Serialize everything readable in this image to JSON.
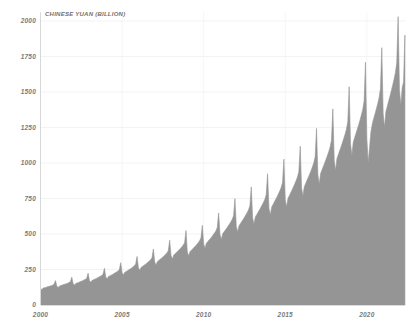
{
  "chart_data": {
    "type": "area",
    "title": "CHINESE YUAN (BILLION)",
    "xlabel": "",
    "ylabel": "CHINESE YUAN (BILLION)",
    "ylim": [
      0,
      2000
    ],
    "xlim": [
      2000,
      2022.4
    ],
    "grid": true,
    "legend_position": "none",
    "yticks": [
      0,
      250,
      500,
      750,
      1000,
      1250,
      1500,
      1750,
      2000
    ],
    "ytick_labels": [
      "0",
      "250",
      "500",
      "750",
      "1000",
      "1250",
      "1500",
      "1750",
      "2000"
    ],
    "xticks": [
      2000,
      2005,
      2010,
      2015,
      2020
    ],
    "xtick_labels": [
      "2000",
      "2005",
      "2010",
      "2015",
      "2020"
    ],
    "series_name": "Chinese Yuan (Billion)",
    "fill_color": "#959595",
    "x": [
      2000.0,
      2000.083,
      2000.167,
      2000.25,
      2000.333,
      2000.417,
      2000.5,
      2000.583,
      2000.667,
      2000.75,
      2000.833,
      2000.917,
      2001.0,
      2001.083,
      2001.167,
      2001.25,
      2001.333,
      2001.417,
      2001.5,
      2001.583,
      2001.667,
      2001.75,
      2001.833,
      2001.917,
      2002.0,
      2002.083,
      2002.167,
      2002.25,
      2002.333,
      2002.417,
      2002.5,
      2002.583,
      2002.667,
      2002.75,
      2002.833,
      2002.917,
      2003.0,
      2003.083,
      2003.167,
      2003.25,
      2003.333,
      2003.417,
      2003.5,
      2003.583,
      2003.667,
      2003.75,
      2003.833,
      2003.917,
      2004.0,
      2004.083,
      2004.167,
      2004.25,
      2004.333,
      2004.417,
      2004.5,
      2004.583,
      2004.667,
      2004.75,
      2004.833,
      2004.917,
      2005.0,
      2005.083,
      2005.167,
      2005.25,
      2005.333,
      2005.417,
      2005.5,
      2005.583,
      2005.667,
      2005.75,
      2005.833,
      2005.917,
      2006.0,
      2006.083,
      2006.167,
      2006.25,
      2006.333,
      2006.417,
      2006.5,
      2006.583,
      2006.667,
      2006.75,
      2006.833,
      2006.917,
      2007.0,
      2007.083,
      2007.167,
      2007.25,
      2007.333,
      2007.417,
      2007.5,
      2007.583,
      2007.667,
      2007.75,
      2007.833,
      2007.917,
      2008.0,
      2008.083,
      2008.167,
      2008.25,
      2008.333,
      2008.417,
      2008.5,
      2008.583,
      2008.667,
      2008.75,
      2008.833,
      2008.917,
      2009.0,
      2009.083,
      2009.167,
      2009.25,
      2009.333,
      2009.417,
      2009.5,
      2009.583,
      2009.667,
      2009.75,
      2009.833,
      2009.917,
      2010.0,
      2010.083,
      2010.167,
      2010.25,
      2010.333,
      2010.417,
      2010.5,
      2010.583,
      2010.667,
      2010.75,
      2010.833,
      2010.917,
      2011.0,
      2011.083,
      2011.167,
      2011.25,
      2011.333,
      2011.417,
      2011.5,
      2011.583,
      2011.667,
      2011.75,
      2011.833,
      2011.917,
      2012.0,
      2012.083,
      2012.167,
      2012.25,
      2012.333,
      2012.417,
      2012.5,
      2012.583,
      2012.667,
      2012.75,
      2012.833,
      2012.917,
      2013.0,
      2013.083,
      2013.167,
      2013.25,
      2013.333,
      2013.417,
      2013.5,
      2013.583,
      2013.667,
      2013.75,
      2013.833,
      2013.917,
      2014.0,
      2014.083,
      2014.167,
      2014.25,
      2014.333,
      2014.417,
      2014.5,
      2014.583,
      2014.667,
      2014.75,
      2014.833,
      2014.917,
      2015.0,
      2015.083,
      2015.167,
      2015.25,
      2015.333,
      2015.417,
      2015.5,
      2015.583,
      2015.667,
      2015.75,
      2015.833,
      2015.917,
      2016.0,
      2016.083,
      2016.167,
      2016.25,
      2016.333,
      2016.417,
      2016.5,
      2016.583,
      2016.667,
      2016.75,
      2016.833,
      2016.917,
      2017.0,
      2017.083,
      2017.167,
      2017.25,
      2017.333,
      2017.417,
      2017.5,
      2017.583,
      2017.667,
      2017.75,
      2017.833,
      2017.917,
      2018.0,
      2018.083,
      2018.167,
      2018.25,
      2018.333,
      2018.417,
      2018.5,
      2018.583,
      2018.667,
      2018.75,
      2018.833,
      2018.917,
      2019.0,
      2019.083,
      2019.167,
      2019.25,
      2019.333,
      2019.417,
      2019.5,
      2019.583,
      2019.667,
      2019.75,
      2019.833,
      2019.917,
      2020.0,
      2020.083,
      2020.167,
      2020.25,
      2020.333,
      2020.417,
      2020.5,
      2020.583,
      2020.667,
      2020.75,
      2020.833,
      2020.917,
      2021.0,
      2021.083,
      2021.167,
      2021.25,
      2021.333,
      2021.417,
      2021.5,
      2021.583,
      2021.667,
      2021.75,
      2021.833,
      2021.917,
      2022.0,
      2022.083,
      2022.167,
      2022.25,
      2022.333
    ],
    "values": [
      118,
      108,
      120,
      122,
      124,
      128,
      130,
      133,
      136,
      140,
      146,
      172,
      132,
      124,
      134,
      137,
      140,
      144,
      147,
      150,
      154,
      158,
      165,
      196,
      150,
      140,
      152,
      155,
      159,
      163,
      167,
      171,
      176,
      181,
      189,
      224,
      172,
      160,
      174,
      178,
      182,
      187,
      192,
      197,
      202,
      208,
      217,
      258,
      198,
      184,
      200,
      205,
      210,
      215,
      221,
      227,
      233,
      240,
      250,
      298,
      228,
      212,
      230,
      236,
      242,
      248,
      254,
      261,
      268,
      276,
      288,
      342,
      262,
      244,
      265,
      272,
      279,
      286,
      293,
      301,
      309,
      318,
      332,
      395,
      302,
      281,
      306,
      314,
      322,
      330,
      338,
      347,
      357,
      367,
      383,
      456,
      348,
      324,
      352,
      361,
      370,
      380,
      389,
      399,
      410,
      422,
      440,
      524,
      372,
      346,
      376,
      386,
      396,
      406,
      416,
      427,
      439,
      452,
      471,
      561,
      430,
      400,
      435,
      446,
      458,
      469,
      481,
      494,
      507,
      522,
      545,
      648,
      497,
      462,
      502,
      515,
      529,
      542,
      556,
      571,
      586,
      603,
      629,
      749,
      552,
      514,
      558,
      573,
      588,
      602,
      618,
      634,
      651,
      670,
      699,
      832,
      613,
      570,
      620,
      636,
      653,
      669,
      686,
      704,
      723,
      744,
      776,
      924,
      681,
      634,
      689,
      707,
      726,
      744,
      763,
      783,
      804,
      827,
      863,
      1027,
      742,
      690,
      750,
      770,
      790,
      810,
      831,
      853,
      876,
      901,
      940,
      1118,
      824,
      767,
      833,
      855,
      878,
      900,
      923,
      947,
      973,
      1001,
      1044,
      1243,
      916,
      852,
      926,
      951,
      976,
      1000,
      1026,
      1053,
      1081,
      1113,
      1161,
      1381,
      1019,
      948,
      1030,
      1058,
      1086,
      1113,
      1142,
      1172,
      1203,
      1238,
      1292,
      1537,
      1134,
      1055,
      1146,
      1177,
      1208,
      1238,
      1270,
      1303,
      1339,
      1377,
      1437,
      1710,
      1172,
      1001,
      1110,
      1219,
      1274,
      1311,
      1345,
      1381,
      1418,
      1459,
      1523,
      1812,
      1346,
      1252,
      1361,
      1398,
      1434,
      1470,
      1508,
      1548,
      1590,
      1636,
      1707,
      2031,
      1512,
      1407,
      1530,
      1571,
      1901
    ]
  }
}
